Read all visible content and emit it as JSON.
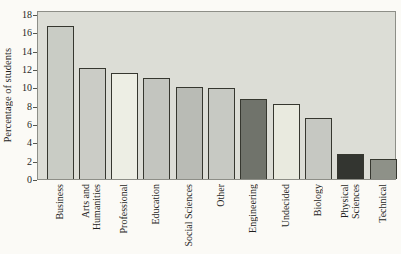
{
  "figure": {
    "background": "#fbfaf6",
    "plot_background": "#dcddd6",
    "plot_border_color": "#8d8e87",
    "bar_outline_color": "#36372f",
    "text_color": "#1f1f1d"
  },
  "chart_data": {
    "type": "bar",
    "title": "",
    "xlabel": "",
    "ylabel": "Percentage of students",
    "ylim": [
      0,
      18
    ],
    "yticks": [
      0,
      2,
      4,
      6,
      8,
      10,
      12,
      14,
      16,
      18
    ],
    "grid": false,
    "legend": "none",
    "categories": [
      "Business",
      "Arts and Humanities",
      "Professional",
      "Education",
      "Social Sciences",
      "Other",
      "Engineering",
      "Undecided",
      "Biology",
      "Physical Sciences",
      "Technical"
    ],
    "category_display": [
      "Business",
      "Arts and\nHumanities",
      "Professional",
      "Education",
      "Social Sciences",
      "Other",
      "Engineering",
      "Undecided",
      "Biology",
      "Physical\nSciences",
      "Technical"
    ],
    "values": [
      16.7,
      12.1,
      11.6,
      11.0,
      10.0,
      9.9,
      8.7,
      8.2,
      6.6,
      2.7,
      2.2
    ],
    "bar_colors": [
      "#c9ccc5",
      "#cbccc6",
      "#edeee4",
      "#c3c5bf",
      "#b9bbb5",
      "#c7c9c3",
      "#70736b",
      "#e9eadf",
      "#c6c8c2",
      "#333530",
      "#8e9188"
    ]
  }
}
